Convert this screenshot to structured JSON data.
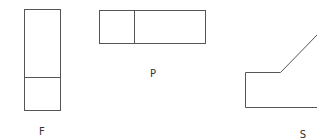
{
  "diagram": {
    "type": "orthographic-projection-views",
    "views": [
      {
        "id": "front",
        "label": "F"
      },
      {
        "id": "plan",
        "label": "P"
      },
      {
        "id": "side",
        "label": "S"
      }
    ],
    "stroke_color": "#555555"
  }
}
